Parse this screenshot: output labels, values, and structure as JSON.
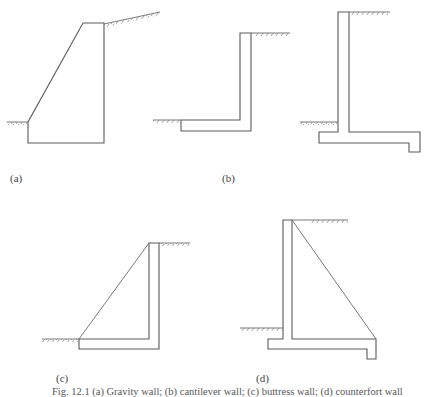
{
  "figure": {
    "labels": {
      "a": "(a)",
      "b": "(b)",
      "c": "(c)",
      "d": "(d)"
    },
    "caption": "Fig. 12.1 (a) Gravity wall; (b) cantilever wall; (c) buttress wall; (d) counterfort wall",
    "stroke_color": "#5a5a5a",
    "background": "#ffffff"
  }
}
